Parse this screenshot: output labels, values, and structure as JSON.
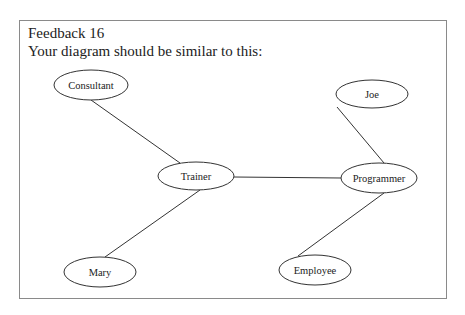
{
  "header": {
    "title": "Feedback 16",
    "subtitle": "Your diagram should be similar to this:"
  },
  "diagram": {
    "nodes": [
      {
        "id": "consultant",
        "label": "Consultant",
        "cx": 91,
        "cy": 85,
        "rx": 37,
        "ry": 15
      },
      {
        "id": "joe",
        "label": "Joe",
        "cx": 372,
        "cy": 94,
        "rx": 36,
        "ry": 14
      },
      {
        "id": "trainer",
        "label": "Trainer",
        "cx": 196,
        "cy": 176,
        "rx": 38,
        "ry": 14
      },
      {
        "id": "programmer",
        "label": "Programmer",
        "cx": 379,
        "cy": 178,
        "rx": 38,
        "ry": 15
      },
      {
        "id": "mary",
        "label": "Mary",
        "cx": 100,
        "cy": 272,
        "rx": 36,
        "ry": 15
      },
      {
        "id": "employee",
        "label": "Employee",
        "cx": 315,
        "cy": 270,
        "rx": 36,
        "ry": 15
      }
    ],
    "edges": [
      {
        "from": "consultant",
        "to": "trainer"
      },
      {
        "from": "trainer",
        "to": "programmer"
      },
      {
        "from": "joe",
        "to": "programmer"
      },
      {
        "from": "trainer",
        "to": "mary"
      },
      {
        "from": "programmer",
        "to": "employee"
      }
    ]
  }
}
